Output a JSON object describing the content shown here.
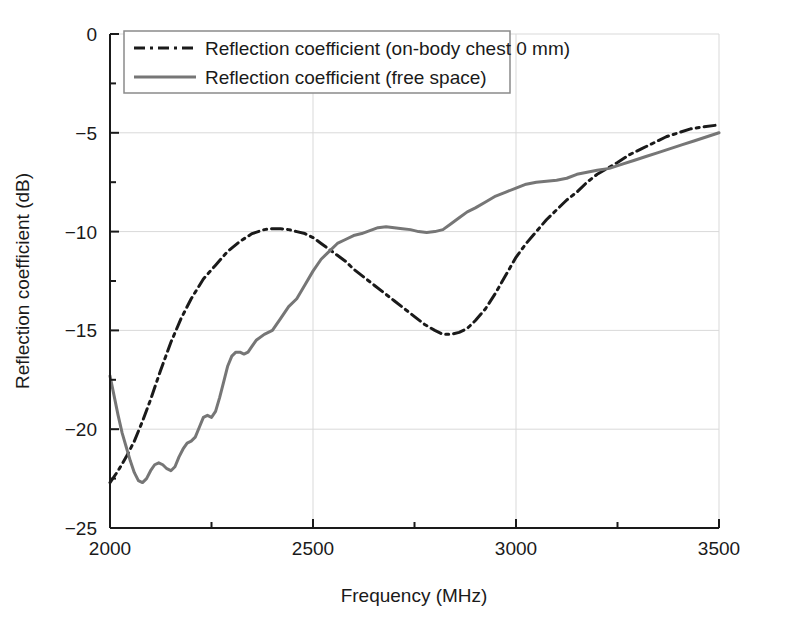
{
  "chart_data": {
    "type": "line",
    "title": "",
    "xlabel": "Frequency (MHz)",
    "ylabel": "Reflection coefficient (dB)",
    "xlim": [
      2000,
      3500
    ],
    "ylim": [
      -25,
      0
    ],
    "xticks": [
      2000,
      2500,
      3000,
      3500
    ],
    "xtick_labels": [
      "2000",
      "2500",
      "3000",
      "3500"
    ],
    "xminorticks": [
      2250,
      2750,
      3250
    ],
    "yticks": [
      0,
      -5,
      -10,
      -15,
      -20,
      -25
    ],
    "ytick_labels": [
      "0",
      "−5",
      "−10",
      "−15",
      "−20",
      "−25"
    ],
    "yminorticks": [
      -2.5,
      -7.5,
      -12.5,
      -17.5,
      -22.5
    ],
    "grid": "major-x-and-y",
    "grid_color": "#d9d9d9",
    "axis_color": "#1a1a1a",
    "legend_position": "top-left-inside",
    "series": [
      {
        "name": "Reflection coefficient (on-body chest 0 mm)",
        "style": "dash-dot",
        "color": "#1a1a1a",
        "width": 3,
        "x": [
          2000,
          2020,
          2040,
          2060,
          2080,
          2100,
          2125,
          2150,
          2175,
          2200,
          2230,
          2260,
          2290,
          2320,
          2350,
          2380,
          2400,
          2420,
          2440,
          2460,
          2480,
          2500,
          2520,
          2540,
          2560,
          2580,
          2600,
          2625,
          2650,
          2675,
          2700,
          2725,
          2750,
          2775,
          2800,
          2820,
          2840,
          2860,
          2880,
          2900,
          2925,
          2950,
          2975,
          3000,
          3025,
          3050,
          3075,
          3100,
          3125,
          3150,
          3175,
          3200,
          3225,
          3250,
          3280,
          3310,
          3340,
          3370,
          3400,
          3430,
          3460,
          3500
        ],
        "y": [
          -22.7,
          -22.1,
          -21.4,
          -20.6,
          -19.6,
          -18.5,
          -17.0,
          -15.6,
          -14.4,
          -13.4,
          -12.4,
          -11.7,
          -11.0,
          -10.5,
          -10.1,
          -9.9,
          -9.85,
          -9.85,
          -9.9,
          -10.0,
          -10.1,
          -10.3,
          -10.6,
          -10.9,
          -11.2,
          -11.5,
          -11.9,
          -12.3,
          -12.7,
          -13.1,
          -13.5,
          -13.9,
          -14.3,
          -14.7,
          -15.0,
          -15.2,
          -15.2,
          -15.1,
          -14.9,
          -14.5,
          -13.9,
          -13.1,
          -12.2,
          -11.3,
          -10.6,
          -10.0,
          -9.4,
          -8.9,
          -8.4,
          -8.0,
          -7.5,
          -7.1,
          -6.8,
          -6.5,
          -6.1,
          -5.8,
          -5.5,
          -5.2,
          -5.0,
          -4.8,
          -4.7,
          -4.6
        ]
      },
      {
        "name": "Reflection coefficient (free space)",
        "style": "solid",
        "color": "#767676",
        "width": 3,
        "x": [
          2000,
          2010,
          2020,
          2030,
          2040,
          2050,
          2060,
          2070,
          2080,
          2090,
          2100,
          2110,
          2120,
          2130,
          2140,
          2150,
          2160,
          2170,
          2180,
          2190,
          2200,
          2210,
          2220,
          2230,
          2240,
          2250,
          2260,
          2270,
          2280,
          2290,
          2300,
          2310,
          2320,
          2330,
          2340,
          2350,
          2360,
          2380,
          2400,
          2420,
          2440,
          2460,
          2480,
          2500,
          2520,
          2540,
          2560,
          2580,
          2600,
          2620,
          2640,
          2660,
          2680,
          2700,
          2720,
          2740,
          2760,
          2780,
          2800,
          2820,
          2840,
          2860,
          2880,
          2900,
          2925,
          2950,
          2975,
          3000,
          3025,
          3050,
          3075,
          3100,
          3125,
          3150,
          3175,
          3200,
          3230,
          3260,
          3290,
          3320,
          3350,
          3380,
          3410,
          3440,
          3470,
          3500
        ],
        "y": [
          -17.3,
          -18.3,
          -19.3,
          -20.2,
          -20.9,
          -21.6,
          -22.2,
          -22.6,
          -22.7,
          -22.5,
          -22.1,
          -21.8,
          -21.7,
          -21.8,
          -22.0,
          -22.1,
          -21.9,
          -21.4,
          -21.0,
          -20.7,
          -20.6,
          -20.4,
          -19.9,
          -19.4,
          -19.3,
          -19.4,
          -19.1,
          -18.4,
          -17.6,
          -16.8,
          -16.3,
          -16.1,
          -16.1,
          -16.2,
          -16.1,
          -15.8,
          -15.5,
          -15.2,
          -15.0,
          -14.4,
          -13.8,
          -13.4,
          -12.7,
          -12.0,
          -11.4,
          -11.0,
          -10.6,
          -10.4,
          -10.2,
          -10.1,
          -9.95,
          -9.8,
          -9.75,
          -9.8,
          -9.85,
          -9.9,
          -10.0,
          -10.05,
          -10.0,
          -9.9,
          -9.6,
          -9.3,
          -9.0,
          -8.8,
          -8.5,
          -8.2,
          -8.0,
          -7.8,
          -7.6,
          -7.5,
          -7.45,
          -7.4,
          -7.3,
          -7.1,
          -7.0,
          -6.9,
          -6.8,
          -6.6,
          -6.4,
          -6.2,
          -6.0,
          -5.8,
          -5.6,
          -5.4,
          -5.2,
          -5.0
        ]
      }
    ],
    "legend_entries": [
      {
        "label": "Reflection coefficient (on-body chest 0 mm)",
        "style": "dash-dot",
        "color": "#1a1a1a"
      },
      {
        "label": "Reflection coefficient (free space)",
        "style": "solid",
        "color": "#767676"
      }
    ]
  }
}
